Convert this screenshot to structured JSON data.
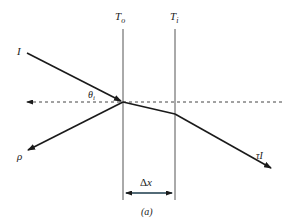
{
  "diagram": {
    "labels": {
      "boundary_outer": "T",
      "boundary_outer_sub": "o",
      "boundary_inner": "T",
      "boundary_inner_sub": "i",
      "incident": "I",
      "angle": "θ",
      "angle_sub": "i",
      "reflected": "ρ",
      "transmitted": "τI",
      "thickness_delta": "Δ",
      "thickness_var": "x",
      "caption": "(a)"
    },
    "colors": {
      "line": "#1a1a1a",
      "boundary": "#555555",
      "dashed": "#444444",
      "arrow_accent": "#1a3a4a"
    }
  }
}
